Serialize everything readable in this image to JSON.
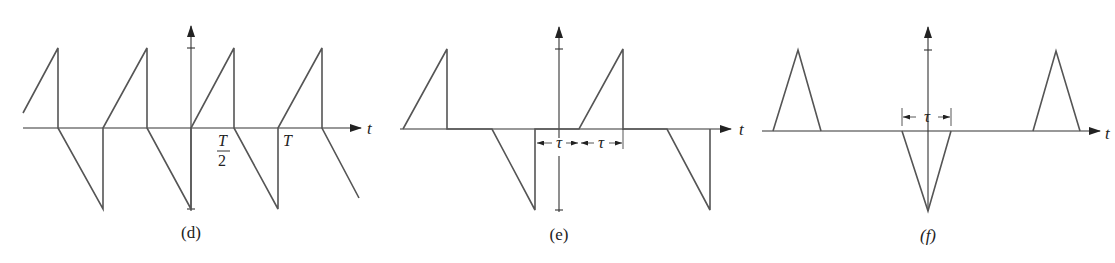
{
  "figure": {
    "panels": [
      {
        "id": "d",
        "caption": "(d)",
        "axis_label": "t",
        "labels": {
          "half_period_num": "T",
          "half_period_den": "2",
          "period": "T"
        },
        "description": "Sawtooth-like periodic wave alternating positive rising ramps and negative falling ramps, period T, half-period T/2"
      },
      {
        "id": "e",
        "caption": "(e)",
        "axis_label": "t",
        "labels": {
          "tau_left": "τ",
          "tau_right": "τ"
        },
        "description": "Pulses: positive rising ramps of width τ and negative falling ramps of width τ, separated by zero intervals"
      },
      {
        "id": "f",
        "caption": "(f)",
        "axis_label": "t",
        "labels": {
          "tau": "τ"
        },
        "description": "Triangular pulses: positive triangles at sides, inverted triangle of width τ centered at origin"
      }
    ],
    "colors": {
      "waveform": "#555555",
      "axis": "#333333",
      "background": "#ffffff"
    }
  }
}
